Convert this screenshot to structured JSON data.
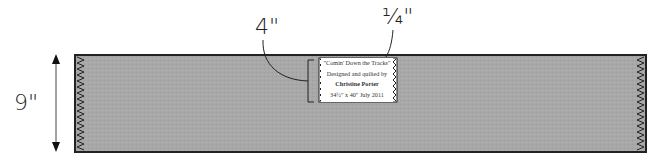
{
  "diagram": {
    "dimensions": {
      "height_label": "9\"",
      "label_height": "4\"",
      "label_inset": "¼\""
    },
    "quilt_label": {
      "lines": [
        "\"Comin' Down the Tracks\"",
        "Designed and quilted by",
        "Christine Porter",
        "34½\" x 40\" July 2011"
      ]
    },
    "colors": {
      "fabric": "#a6a6a6",
      "outline": "#222222",
      "label_bg": "#ffffff"
    }
  }
}
